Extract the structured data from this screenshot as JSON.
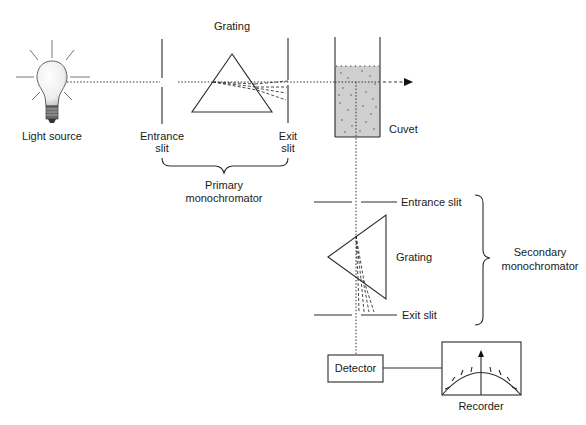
{
  "diagram": {
    "labels": {
      "light_source": "Light source",
      "primary_grating": "Grating",
      "primary_entrance_slit_line1": "Entrance",
      "primary_entrance_slit_line2": "slit",
      "primary_exit_slit_line1": "Exit",
      "primary_exit_slit_line2": "slit",
      "primary_monochromator_line1": "Primary",
      "primary_monochromator_line2": "monochromator",
      "cuvet": "Cuvet",
      "secondary_entrance_slit": "Entrance slit",
      "secondary_grating": "Grating",
      "secondary_exit_slit": "Exit slit",
      "secondary_monochromator_line1": "Secondary",
      "secondary_monochromator_line2": "monochromator",
      "detector": "Detector",
      "recorder": "Recorder"
    },
    "components": [
      {
        "id": "light-source",
        "icon": "light-bulb-icon"
      },
      {
        "id": "primary-entrance-slit"
      },
      {
        "id": "primary-grating",
        "shape": "triangle"
      },
      {
        "id": "primary-exit-slit"
      },
      {
        "id": "cuvet",
        "shape": "rectangle"
      },
      {
        "id": "secondary-entrance-slit"
      },
      {
        "id": "secondary-grating",
        "shape": "triangle"
      },
      {
        "id": "secondary-exit-slit"
      },
      {
        "id": "detector",
        "shape": "box"
      },
      {
        "id": "recorder",
        "icon": "meter-gauge-icon"
      }
    ],
    "colors": {
      "line": "#2a2a2a",
      "cuvet_fill": "#cfcfcf",
      "bulb_fill": "#f2f2f2",
      "background": "#ffffff"
    }
  }
}
